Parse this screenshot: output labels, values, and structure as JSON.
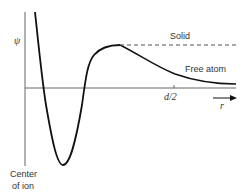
{
  "diagram": {
    "y_axis_label": "ψ",
    "x_axis_label": "r",
    "tick_label": "d/2",
    "curve_labels": {
      "solid": "Solid",
      "free_atom": "Free atom"
    },
    "origin_label_line1": "Center",
    "origin_label_line2": "of ion",
    "colors": {
      "line": "#111111",
      "axis": "#555555",
      "text": "#333333"
    }
  }
}
